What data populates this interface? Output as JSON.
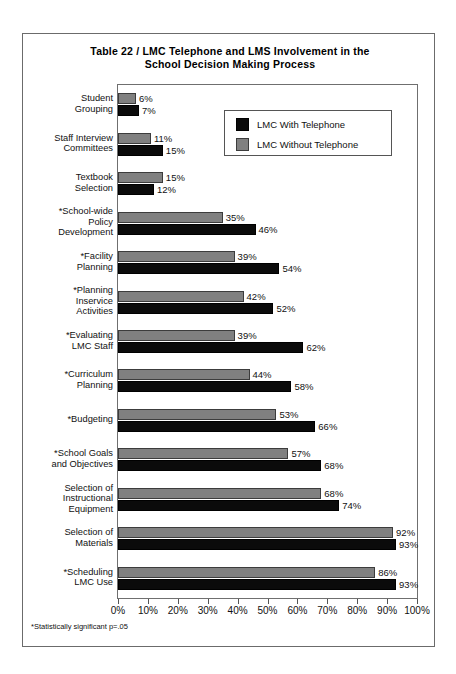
{
  "title": {
    "line1": "Table 22  /  LMC Telephone and LMS Involvement in the",
    "line2": "School Decision Making Process"
  },
  "legend": {
    "items": [
      {
        "label": "LMC With Telephone",
        "color": "#0b0b0b",
        "key": "with"
      },
      {
        "label": "LMC Without Telephone",
        "color": "#808080",
        "key": "without"
      }
    ]
  },
  "axis": {
    "ticks": [
      "0%",
      "10%",
      "20%",
      "30%",
      "40%",
      "50%",
      "60%",
      "70%",
      "80%",
      "90%",
      "100%"
    ]
  },
  "footnote": "*Statistically significant p=.05",
  "chart_data": {
    "type": "bar",
    "orientation": "horizontal",
    "title": "Table 22  /  LMC Telephone and LMS Involvement in the School Decision Making Process",
    "xlabel": "",
    "ylabel": "",
    "xlim": [
      0,
      100
    ],
    "grid": false,
    "legend_position": "top-right",
    "categories": [
      "Student Grouping",
      "Staff Interview Committees",
      "Textbook Selection",
      "*School-wide Policy Development",
      "*Facility Planning",
      "*Planning Inservice Activities",
      "*Evaluating LMC Staff",
      "*Curriculum Planning",
      "*Budgeting",
      "*School Goals and Objectives",
      "Selection of Instructional Equipment",
      "Selection of Materials",
      "*Scheduling LMC Use"
    ],
    "category_lines": [
      [
        "Student",
        "Grouping"
      ],
      [
        "Staff Interview",
        "Committees"
      ],
      [
        "Textbook",
        "Selection"
      ],
      [
        "*School-wide",
        "Policy",
        "Development"
      ],
      [
        "*Facility",
        "Planning"
      ],
      [
        "*Planning",
        "Inservice",
        "Activities"
      ],
      [
        "*Evaluating",
        "LMC Staff"
      ],
      [
        "*Curriculum",
        "Planning"
      ],
      [
        "*Budgeting"
      ],
      [
        "*School Goals",
        "and Objectives"
      ],
      [
        "Selection of",
        "Instructional",
        "Equipment"
      ],
      [
        "Selection of",
        "Materials"
      ],
      [
        "*Scheduling",
        "LMC Use"
      ]
    ],
    "series": [
      {
        "name": "LMC Without Telephone",
        "color": "#808080",
        "values": [
          6,
          11,
          15,
          35,
          39,
          42,
          39,
          44,
          53,
          57,
          68,
          92,
          86
        ],
        "labels": [
          "6%",
          "11%",
          "15%",
          "35%",
          "39%",
          "42%",
          "39%",
          "44%",
          "53%",
          "57%",
          "68%",
          "92%",
          "86%"
        ]
      },
      {
        "name": "LMC With Telephone",
        "color": "#0b0b0b",
        "values": [
          7,
          15,
          12,
          46,
          54,
          52,
          62,
          58,
          66,
          68,
          74,
          93,
          93
        ],
        "labels": [
          "7%",
          "15%",
          "12%",
          "46%",
          "54%",
          "52%",
          "62%",
          "58%",
          "66%",
          "68%",
          "74%",
          "93%",
          "93%"
        ]
      }
    ]
  }
}
